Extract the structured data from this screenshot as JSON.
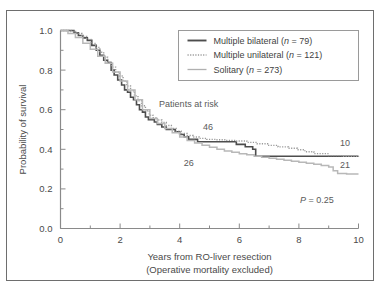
{
  "figure": {
    "border_color": "#6e6e6e",
    "background": "#ffffff"
  },
  "axes": {
    "x_title_line1": "Years from RO-liver resection",
    "x_title_line2": "(Operative mortality excluded)",
    "y_title": "Probability of survival",
    "x_tick_labels": [
      "0",
      "2",
      "4",
      "6",
      "8",
      "10"
    ],
    "y_tick_labels": [
      "0.0",
      "0.2",
      "0.4",
      "0.6",
      "0.8",
      "1.0"
    ],
    "axis_color": "#8a8a8a"
  },
  "legend": {
    "items": [
      {
        "label": "Multiple bilateral (n = 79)",
        "text_main": "Multiple bilateral (",
        "n_symbol": "n",
        "n_value": " = 79)",
        "style": "solid-dark",
        "color": "#4d4d4d"
      },
      {
        "label": "Multiple unilateral (n = 121)",
        "text_main": "Multiple unilateral (",
        "n_symbol": "n",
        "n_value": " = 121)",
        "style": "dotted",
        "color": "#9a9a9a"
      },
      {
        "label": "Solitary   (n = 273)",
        "text_main": "Solitary   (",
        "n_symbol": "n",
        "n_value": " = 273)",
        "style": "solid-light",
        "color": "#b0b0b0"
      }
    ]
  },
  "annotations": {
    "patients_at_risk": "Patients at risk",
    "risk_46": "46",
    "risk_26": "26",
    "risk_10": "10",
    "risk_21": "21",
    "p_symbol": "P",
    "p_value": " = 0.25"
  },
  "chart_data": {
    "type": "line",
    "title": "",
    "xlabel": "Years from RO-liver resection (Operative mortality excluded)",
    "ylabel": "Probability of survival",
    "xlim": [
      0,
      10
    ],
    "ylim": [
      0.0,
      1.0
    ],
    "xticks": [
      0,
      1,
      2,
      3,
      4,
      5,
      6,
      7,
      8,
      9,
      10
    ],
    "xticks_major": [
      0,
      2,
      4,
      6,
      8,
      10
    ],
    "yticks": [
      0.0,
      0.1,
      0.2,
      0.3,
      0.4,
      0.5,
      0.6,
      0.7,
      0.8,
      0.9,
      1.0
    ],
    "yticks_major": [
      0.0,
      0.2,
      0.4,
      0.6,
      0.8,
      1.0
    ],
    "grid": false,
    "legend_position": "top-right",
    "curve_style": "step",
    "series": [
      {
        "name": "Multiple bilateral (n = 79)",
        "n": 79,
        "color": "#4d4d4d",
        "line_style": "solid",
        "line_width": 1.6,
        "x": [
          0.0,
          0.3,
          0.45,
          0.6,
          0.75,
          0.9,
          1.05,
          1.2,
          1.32,
          1.45,
          1.58,
          1.7,
          1.8,
          1.92,
          2.05,
          2.15,
          2.25,
          2.35,
          2.45,
          2.55,
          2.65,
          2.75,
          2.85,
          2.95,
          3.05,
          3.15,
          3.25,
          3.4,
          3.55,
          3.7,
          3.85,
          4.0,
          4.15,
          4.3,
          4.45,
          4.6,
          4.8,
          5.05,
          5.3,
          5.6,
          5.9,
          6.2,
          6.45,
          6.55,
          7.0,
          7.6,
          8.2,
          9.0,
          9.6,
          10.0
        ],
        "y": [
          1.0,
          1.0,
          0.988,
          0.975,
          0.963,
          0.95,
          0.925,
          0.9,
          0.875,
          0.85,
          0.838,
          0.8,
          0.775,
          0.75,
          0.725,
          0.7,
          0.688,
          0.663,
          0.65,
          0.625,
          0.6,
          0.588,
          0.563,
          0.55,
          0.55,
          0.538,
          0.525,
          0.513,
          0.5,
          0.5,
          0.488,
          0.475,
          0.463,
          0.45,
          0.45,
          0.438,
          0.438,
          0.438,
          0.438,
          0.438,
          0.425,
          0.413,
          0.4,
          0.365,
          0.365,
          0.365,
          0.365,
          0.365,
          0.365,
          0.365
        ]
      },
      {
        "name": "Multiple unilateral (n = 121)",
        "n": 121,
        "color": "#9a9a9a",
        "line_style": "dotted",
        "line_width": 1.4,
        "x": [
          0.0,
          0.35,
          0.55,
          0.72,
          0.88,
          1.02,
          1.18,
          1.32,
          1.45,
          1.58,
          1.72,
          1.85,
          1.98,
          2.1,
          2.22,
          2.35,
          2.48,
          2.6,
          2.72,
          2.85,
          2.98,
          3.1,
          3.25,
          3.4,
          3.55,
          3.72,
          3.88,
          4.05,
          4.25,
          4.45,
          4.65,
          4.9,
          5.2,
          5.55,
          5.9,
          6.25,
          6.6,
          6.95,
          7.3,
          7.65,
          7.95,
          8.2,
          8.5,
          9.0,
          9.5,
          10.0
        ],
        "y": [
          1.0,
          0.995,
          0.985,
          0.97,
          0.955,
          0.935,
          0.915,
          0.89,
          0.865,
          0.84,
          0.815,
          0.79,
          0.77,
          0.745,
          0.72,
          0.695,
          0.67,
          0.645,
          0.62,
          0.595,
          0.572,
          0.56,
          0.548,
          0.535,
          0.52,
          0.505,
          0.492,
          0.48,
          0.47,
          0.462,
          0.455,
          0.45,
          0.448,
          0.445,
          0.442,
          0.435,
          0.428,
          0.42,
          0.412,
          0.405,
          0.398,
          0.388,
          0.378,
          0.368,
          0.365,
          0.363
        ]
      },
      {
        "name": "Solitary (n = 273)",
        "n": 273,
        "color": "#b8b8b8",
        "line_style": "solid",
        "line_width": 1.5,
        "x": [
          0.0,
          0.25,
          0.5,
          0.75,
          1.0,
          1.25,
          1.5,
          1.75,
          2.0,
          2.25,
          2.5,
          2.75,
          3.0,
          3.25,
          3.5,
          3.75,
          4.0,
          4.25,
          4.5,
          4.75,
          5.0,
          5.25,
          5.5,
          5.75,
          6.0,
          6.25,
          6.5,
          6.75,
          7.0,
          7.25,
          7.5,
          7.75,
          8.0,
          8.25,
          8.5,
          8.75,
          9.0,
          9.15,
          9.3,
          9.6,
          10.0
        ],
        "y": [
          1.0,
          0.985,
          0.965,
          0.935,
          0.905,
          0.87,
          0.835,
          0.79,
          0.745,
          0.7,
          0.65,
          0.6,
          0.555,
          0.53,
          0.505,
          0.483,
          0.462,
          0.445,
          0.432,
          0.42,
          0.41,
          0.4,
          0.392,
          0.385,
          0.378,
          0.372,
          0.365,
          0.36,
          0.355,
          0.35,
          0.345,
          0.34,
          0.335,
          0.33,
          0.325,
          0.318,
          0.31,
          0.292,
          0.278,
          0.275,
          0.275
        ]
      }
    ],
    "annotations": [
      {
        "text": "Patients at risk",
        "x": 4.3,
        "y": 0.615
      },
      {
        "text": "46",
        "x": 4.95,
        "y": 0.495
      },
      {
        "text": "26",
        "x": 4.3,
        "y": 0.315
      },
      {
        "text": "10",
        "x": 9.55,
        "y": 0.418
      },
      {
        "text": "21",
        "x": 9.55,
        "y": 0.305
      },
      {
        "text": "P = 0.25",
        "x": 8.6,
        "y": 0.13
      }
    ]
  }
}
